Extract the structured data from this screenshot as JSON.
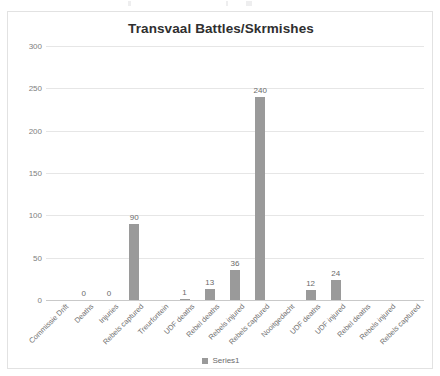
{
  "chart_data": {
    "type": "bar",
    "title": "Transvaal Battles/Skrmishes",
    "xlabel": "",
    "ylabel": "",
    "ylim": [
      0,
      300
    ],
    "yticks": [
      0,
      50,
      100,
      150,
      200,
      250,
      300
    ],
    "grid": true,
    "legend": {
      "position": "bottom",
      "entries": [
        "Series1"
      ]
    },
    "series": [
      {
        "name": "Series1",
        "values": [
          null,
          0,
          0,
          90,
          null,
          1,
          13,
          36,
          240,
          null,
          12,
          24,
          null,
          null,
          null
        ]
      }
    ],
    "categories": [
      "Commissie Drift",
      "Deaths",
      "Injuries",
      "Rebels captured",
      "Treurfontein",
      "UDF deaths",
      "Rebel deaths",
      "Rebels injured",
      "Rebels captured",
      "Nooitgedacht",
      "UDF deaths",
      "UDF injured",
      "Rebel deaths",
      "Rebels injured",
      "Rebels captured"
    ],
    "point_labels": [
      "",
      "0",
      "0",
      "90",
      "",
      "1",
      "13",
      "36",
      "240",
      "",
      "12",
      "24",
      "",
      "",
      ""
    ],
    "colors": {
      "bar": "#9a9a9a",
      "grid": "#e6e6e6",
      "axis": "#c9c9c9",
      "text": "#6f6f6f",
      "title": "#2f2f2f"
    }
  },
  "legend": {
    "label": "Series1"
  }
}
